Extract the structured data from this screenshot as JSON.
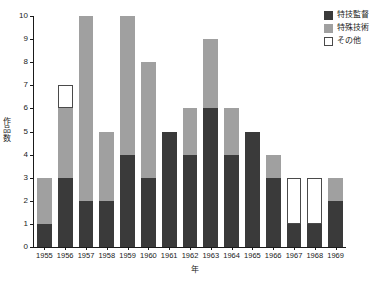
{
  "chart_data": {
    "type": "bar",
    "stacked": true,
    "title": "",
    "xlabel": "年",
    "ylabel": "作品数",
    "categories": [
      "1955",
      "1956",
      "1957",
      "1958",
      "1959",
      "1960",
      "1961",
      "1962",
      "1963",
      "1964",
      "1965",
      "1966",
      "1967",
      "1968",
      "1969"
    ],
    "series": [
      {
        "name": "特技監督",
        "color": "#3a3a3a",
        "values": [
          1,
          3,
          2,
          2,
          4,
          3,
          5,
          4,
          6,
          4,
          5,
          3,
          1,
          1,
          2
        ]
      },
      {
        "name": "特殊技術",
        "color": "#a0a0a0",
        "values": [
          2,
          3,
          8,
          3,
          6,
          5,
          0,
          2,
          3,
          2,
          0,
          1,
          0,
          0,
          1
        ]
      },
      {
        "name": "その他",
        "color": "#ffffff",
        "values": [
          0,
          1,
          0,
          0,
          0,
          0,
          0,
          0,
          0,
          0,
          0,
          0,
          2,
          2,
          0
        ]
      }
    ],
    "totals": [
      3,
      7,
      10,
      5,
      10,
      8,
      5,
      6,
      9,
      6,
      5,
      4,
      3,
      3,
      3
    ],
    "ylim": [
      0,
      10
    ],
    "yticks": [
      "0",
      "1",
      "2",
      "3",
      "4",
      "5",
      "6",
      "7",
      "8",
      "9",
      "10"
    ],
    "grid": false,
    "legend_position": "top-right"
  },
  "legend": {
    "entries": [
      {
        "label": "特技監督",
        "swatch": "dark"
      },
      {
        "label": "特殊技術",
        "swatch": "gray"
      },
      {
        "label": "その他",
        "swatch": "white"
      }
    ]
  }
}
